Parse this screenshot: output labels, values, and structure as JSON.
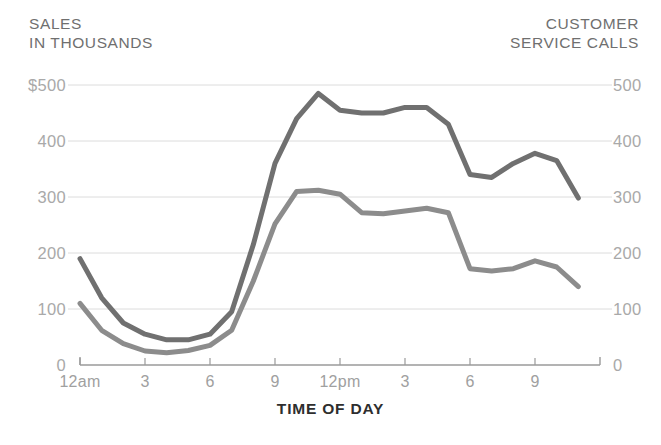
{
  "chart_data": {
    "type": "line",
    "title": "",
    "xlabel": "TIME OF DAY",
    "left_axis_title": "SALES\nIN THOUSANDS",
    "right_axis_title": "CUSTOMER\nSERVICE CALLS",
    "grid": true,
    "legend": "none",
    "x_tick_labels": [
      "12am",
      "3",
      "6",
      "9",
      "12pm",
      "3",
      "6",
      "9"
    ],
    "x_tick_hours": [
      0,
      3,
      6,
      9,
      12,
      15,
      18,
      21
    ],
    "xlim": [
      0,
      24
    ],
    "left_ylim": [
      0,
      500
    ],
    "right_ylim": [
      0,
      500
    ],
    "left_y_ticks": [
      "0",
      "100",
      "200",
      "300",
      "400",
      "$500"
    ],
    "right_y_ticks": [
      "0",
      "100",
      "200",
      "300",
      "400",
      "500"
    ],
    "left_y_tick_values": [
      0,
      100,
      200,
      300,
      400,
      500
    ],
    "right_y_tick_values": [
      0,
      100,
      200,
      300,
      400,
      500
    ],
    "x": [
      0,
      1,
      2,
      3,
      4,
      5,
      6,
      7,
      8,
      9,
      10,
      11,
      12,
      13,
      14,
      15,
      16,
      17,
      18,
      19,
      20,
      21,
      22,
      23
    ],
    "series": [
      {
        "name": "Customer service calls",
        "axis": "right",
        "color": "#707070",
        "values": [
          190,
          120,
          75,
          55,
          45,
          45,
          55,
          95,
          215,
          360,
          440,
          485,
          455,
          450,
          450,
          460,
          460,
          430,
          340,
          335,
          360,
          378,
          365,
          298
        ]
      },
      {
        "name": "Sales in thousands",
        "axis": "left",
        "color": "#8c8c8c",
        "values": [
          110,
          62,
          38,
          25,
          22,
          26,
          35,
          62,
          150,
          252,
          310,
          312,
          305,
          272,
          270,
          275,
          280,
          272,
          172,
          168,
          172,
          186,
          175,
          140
        ]
      }
    ],
    "colors": {
      "line_dark": "#707070",
      "line_light": "#8c8c8c",
      "gridline": "#dcdcdc",
      "axis": "#9a9a9a",
      "tick_text": "#a9a9a9",
      "title_text": "#6f6f6f",
      "caption_text": "#2e2e2e",
      "background": "#ffffff"
    }
  }
}
